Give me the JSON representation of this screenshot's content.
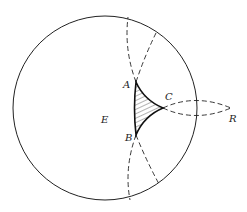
{
  "diagram": {
    "labels": {
      "A": "A",
      "B": "B",
      "C": "C",
      "E": "E",
      "R": "R"
    },
    "colors": {
      "stroke": "#222222",
      "background": "#ffffff"
    }
  }
}
